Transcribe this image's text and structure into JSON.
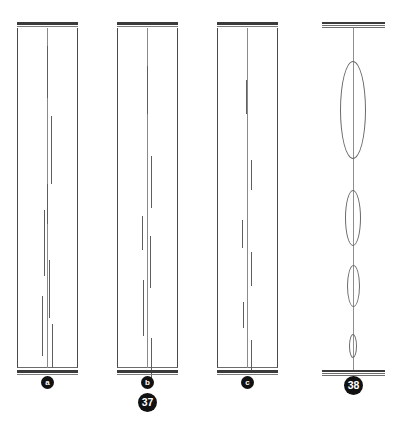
{
  "plate": {
    "title": "Figures 37 and 38 — columnar specimens and lens chain",
    "background_color": "#ffffff",
    "ink_color": "#3b3b3b",
    "line_color": "#6a6a6a",
    "badge_color": "#111111",
    "badge_text_color": "#ffffff",
    "width": 395,
    "height": 427
  },
  "figures": [
    {
      "id": "figure-37",
      "number_label": "37",
      "number_badge": {
        "x": 141,
        "y": 393,
        "size": 19
      },
      "panels": [
        {
          "id": "panel-a",
          "label": "a",
          "label_badge": {
            "x": 41,
            "y": 376,
            "size": 13
          },
          "x": 17,
          "width": 61,
          "height": 346,
          "centerline_offset": 30,
          "ticks": [
            {
              "x": 30,
              "y": 18,
              "length": 52
            },
            {
              "x": 34,
              "y": 88,
              "length": 68
            },
            {
              "x": 27,
              "y": 182,
              "length": 66
            },
            {
              "x": 32,
              "y": 232,
              "length": 58
            },
            {
              "x": 25,
              "y": 268,
              "length": 60
            },
            {
              "x": 35,
              "y": 296,
              "length": 52
            },
            {
              "x": 30,
              "y": 156,
              "length": 40
            }
          ]
        },
        {
          "id": "panel-b",
          "label": "b",
          "label_badge": {
            "x": 141,
            "y": 376,
            "size": 13
          },
          "x": 117,
          "width": 61,
          "height": 346,
          "centerline_offset": 30,
          "ticks": [
            {
              "x": 30,
              "y": 38,
              "length": 48
            },
            {
              "x": 34,
              "y": 128,
              "length": 52
            },
            {
              "x": 25,
              "y": 188,
              "length": 34
            },
            {
              "x": 33,
              "y": 208,
              "length": 52
            },
            {
              "x": 26,
              "y": 252,
              "length": 56
            },
            {
              "x": 34,
              "y": 310,
              "length": 48
            }
          ]
        },
        {
          "id": "panel-c",
          "label": "c",
          "label_badge": {
            "x": 241,
            "y": 376,
            "size": 13
          },
          "x": 217,
          "width": 61,
          "height": 346,
          "centerline_offset": 30,
          "ticks": [
            {
              "x": 29,
              "y": 52,
              "length": 34
            },
            {
              "x": 34,
              "y": 132,
              "length": 30
            },
            {
              "x": 25,
              "y": 192,
              "length": 28
            },
            {
              "x": 34,
              "y": 224,
              "length": 34
            },
            {
              "x": 26,
              "y": 274,
              "length": 26
            },
            {
              "x": 34,
              "y": 312,
              "length": 30
            }
          ]
        }
      ]
    },
    {
      "id": "figure-38",
      "number_label": "38",
      "number_badge": {
        "x": 344,
        "y": 376,
        "size": 19
      },
      "panel": {
        "id": "panel-lens-chain",
        "x": 322,
        "width": 63,
        "height": 346,
        "axis_offset": 31,
        "lenses": [
          {
            "cy": 82,
            "width": 26,
            "height": 98
          },
          {
            "cy": 190,
            "width": 16,
            "height": 56
          },
          {
            "cy": 258,
            "width": 13,
            "height": 42
          },
          {
            "cy": 318,
            "width": 8,
            "height": 24
          }
        ]
      }
    }
  ]
}
